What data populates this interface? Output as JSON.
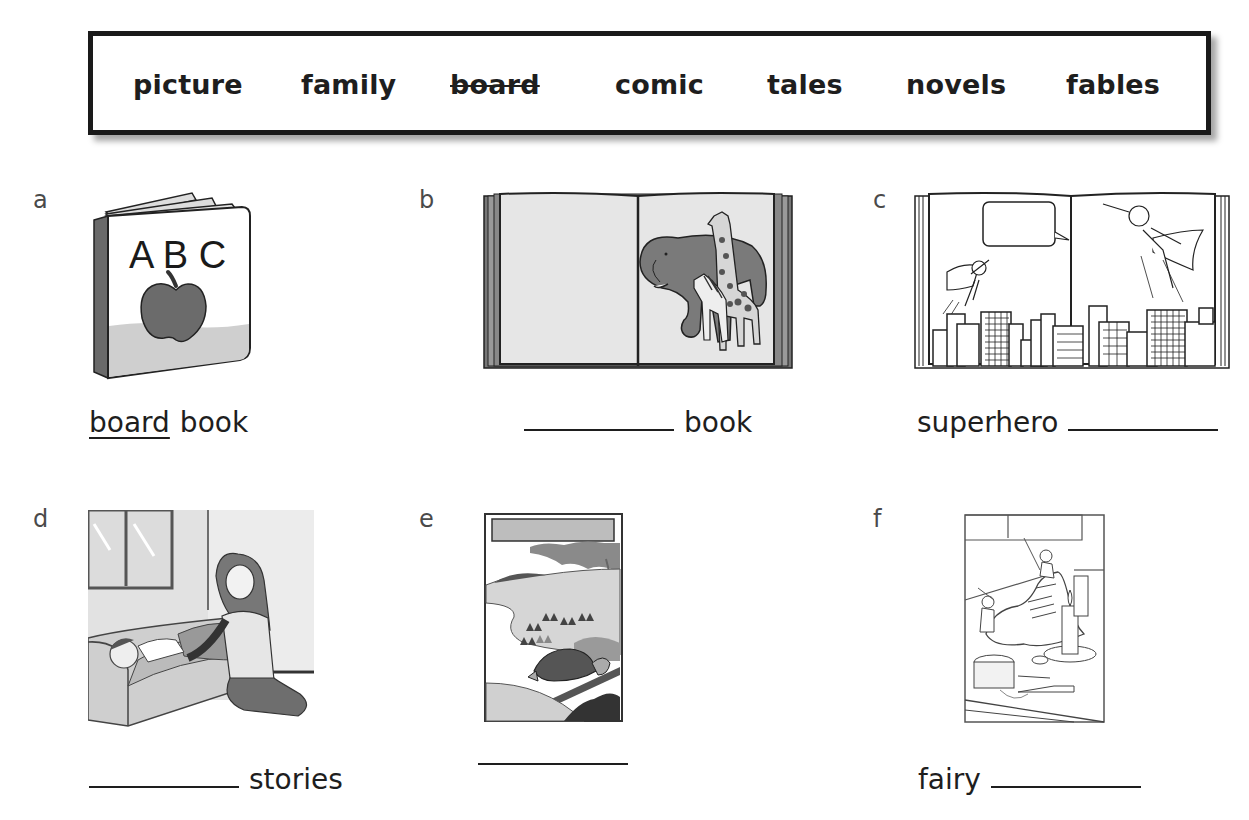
{
  "word_bank": {
    "words": [
      {
        "text": "picture",
        "struck": false
      },
      {
        "text": "family",
        "struck": false
      },
      {
        "text": "board",
        "struck": true
      },
      {
        "text": "comic",
        "struck": false
      },
      {
        "text": "tales",
        "struck": false
      },
      {
        "text": "novels",
        "struck": false
      },
      {
        "text": "fables",
        "struck": false
      }
    ]
  },
  "items": [
    {
      "letter": "a",
      "illustration": "abc-board-book-with-apple",
      "prefix": "",
      "answer": "board",
      "suffix": "book"
    },
    {
      "letter": "b",
      "illustration": "open-book-elephant-giraffe",
      "prefix": "",
      "answer": "",
      "suffix": "book"
    },
    {
      "letter": "c",
      "illustration": "open-comic-book-superheroes-city",
      "prefix": "superhero",
      "answer": "",
      "suffix": ""
    },
    {
      "letter": "d",
      "illustration": "mother-telling-bedtime-story",
      "prefix": "",
      "answer": "",
      "suffix": "stories"
    },
    {
      "letter": "e",
      "illustration": "tortoise-fable-book-cover",
      "prefix": "",
      "answer": "",
      "suffix": ""
    },
    {
      "letter": "f",
      "illustration": "elves-and-shoemaker-picture",
      "prefix": "fairy",
      "answer": "",
      "suffix": ""
    }
  ]
}
